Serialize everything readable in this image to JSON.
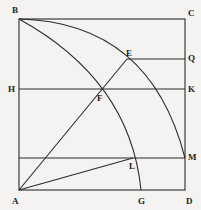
{
  "diagram": {
    "type": "geometric-construction",
    "labels": {
      "B": "B",
      "C": "C",
      "E": "E",
      "Q": "Q",
      "H": "H",
      "K": "K",
      "F": "F",
      "M": "M",
      "L": "L",
      "A": "A",
      "G": "G",
      "D": "D"
    },
    "points": {
      "A": [
        19,
        190
      ],
      "B": [
        19,
        19
      ],
      "C": [
        185,
        19
      ],
      "D": [
        185,
        190
      ],
      "E": [
        127,
        59
      ],
      "Q": [
        185,
        59
      ],
      "H": [
        19,
        89
      ],
      "K": [
        185,
        89
      ],
      "F": [
        100,
        89
      ],
      "L": [
        133,
        158
      ],
      "M": [
        185,
        158
      ],
      "G": [
        141,
        190
      ]
    },
    "line_color": "#2a2a2a"
  }
}
